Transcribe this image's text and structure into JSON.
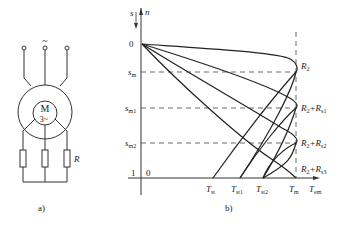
{
  "panel_a": {
    "caption": "a)",
    "supply_symbol": "~",
    "motor_label": "M",
    "motor_phase": "3~",
    "resistor_label": "R"
  },
  "panel_b": {
    "caption": "b)",
    "y_axis_label_s": "s",
    "y_axis_label_n": "n",
    "x_axis_label": "T",
    "x_axis_label_sub": "em",
    "y_ticks": [
      {
        "main": "0",
        "sub": ""
      },
      {
        "main": "s",
        "sub": "m"
      },
      {
        "main": "s",
        "sub": "m1"
      },
      {
        "main": "s",
        "sub": "m2"
      },
      {
        "main": "1",
        "sub": ""
      }
    ],
    "origin_x_label": "0",
    "x_ticks": [
      {
        "main": "T",
        "sub": "st"
      },
      {
        "main": "T",
        "sub": "st1"
      },
      {
        "main": "T",
        "sub": "st2"
      },
      {
        "main": "T",
        "sub": "m"
      }
    ],
    "curve_labels": [
      {
        "main": "R",
        "sub": "2",
        "extra": ""
      },
      {
        "main": "R",
        "sub": "2",
        "extra": "+R",
        "extra_sub": "s1"
      },
      {
        "main": "R",
        "sub": "2",
        "extra": "+R",
        "extra_sub": "s2"
      },
      {
        "main": "R",
        "sub": "2",
        "extra": "+R",
        "extra_sub": "s3"
      }
    ]
  }
}
